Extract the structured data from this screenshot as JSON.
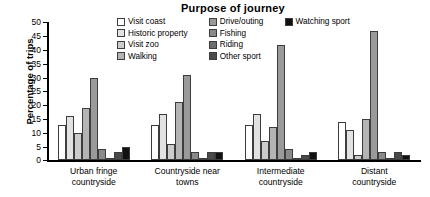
{
  "chart_data": {
    "type": "bar",
    "title": "Purpose of journey",
    "xlabel": "",
    "ylabel": "Percentage of trips",
    "ylim": [
      0,
      50
    ],
    "ytick_step": 5,
    "yticks": [
      50,
      45,
      40,
      35,
      30,
      25,
      20,
      15,
      10,
      5,
      0
    ],
    "grid": false,
    "legend_position": "top-center",
    "categories": [
      "Urban fringe countryside",
      "Countryside near towns",
      "Intermediate countryside",
      "Distant countryside"
    ],
    "series": [
      {
        "name": "Visit coast",
        "color": "#ffffff",
        "values": [
          13,
          13,
          13,
          14
        ]
      },
      {
        "name": "Historic property",
        "color": "#e2e2e2",
        "values": [
          16,
          17,
          17,
          11
        ]
      },
      {
        "name": "Visit zoo",
        "color": "#cccccc",
        "values": [
          10,
          6,
          7,
          2
        ]
      },
      {
        "name": "Walking",
        "color": "#b4b4b4",
        "values": [
          19,
          21,
          12,
          15
        ]
      },
      {
        "name": "Drive/outing",
        "color": "#9a9a9a",
        "values": [
          30,
          31,
          42,
          47
        ]
      },
      {
        "name": "Fishing",
        "color": "#8a8a8a",
        "values": [
          4,
          3,
          4,
          3
        ]
      },
      {
        "name": "Riding",
        "color": "#6e6e6e",
        "values": [
          1,
          1,
          0.3,
          1
        ]
      },
      {
        "name": "Other sport",
        "color": "#4a4a4a",
        "values": [
          3,
          3,
          2,
          3
        ]
      },
      {
        "name": "Watching sport",
        "color": "#111111",
        "values": [
          5,
          3,
          3,
          2
        ]
      }
    ]
  },
  "legend_columns": [
    [
      "Visit coast",
      "Historic property",
      "Visit zoo",
      "Walking"
    ],
    [
      "Drive/outing",
      "Fishing",
      "Riding",
      "Other sport"
    ],
    [
      "Watching sport"
    ]
  ]
}
